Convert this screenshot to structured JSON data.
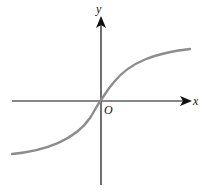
{
  "figure": {
    "type": "function-graph",
    "axes": {
      "x_label": "x",
      "y_label": "y",
      "origin_label": "O"
    },
    "curve": {
      "description": "increasing S-shaped curve through origin with horizontal asymptotes",
      "color": "#8c8c8c"
    },
    "axis_color": "#111111"
  }
}
